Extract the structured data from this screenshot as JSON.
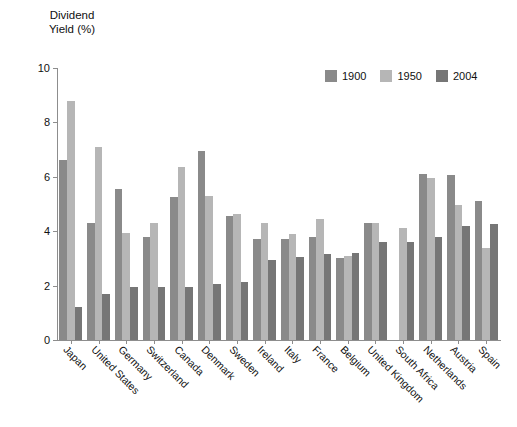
{
  "chart_data": {
    "type": "bar",
    "title": "Dividend\nYield (%)",
    "ylabel": "Dividend Yield (%)",
    "xlabel": "",
    "ylim": [
      0,
      10
    ],
    "yticks": [
      0,
      2,
      4,
      6,
      8,
      10
    ],
    "grid": false,
    "legend_position": "top-right",
    "categories": [
      "Japan",
      "United States",
      "Germany",
      "Switzerland",
      "Canada",
      "Denmark",
      "Sweden",
      "Ireland",
      "Italy",
      "France",
      "Belgium",
      "United Kingdom",
      "South Africa",
      "Netherlands",
      "Austria",
      "Spain"
    ],
    "series": [
      {
        "name": "1900",
        "color": "#8a8a8a",
        "values": [
          6.6,
          4.3,
          5.55,
          3.8,
          5.25,
          6.95,
          4.55,
          3.7,
          3.7,
          3.8,
          3.0,
          4.3,
          0.0,
          6.1,
          6.05,
          5.1
        ]
      },
      {
        "name": "1950",
        "color": "#b6b6b6",
        "values": [
          8.8,
          7.1,
          3.95,
          4.3,
          6.35,
          5.3,
          4.65,
          4.3,
          3.9,
          4.45,
          3.1,
          4.3,
          4.1,
          5.95,
          4.95,
          3.4
        ]
      },
      {
        "name": "2004",
        "color": "#767676",
        "values": [
          1.2,
          1.7,
          1.95,
          1.95,
          1.95,
          2.05,
          2.15,
          2.95,
          3.05,
          3.15,
          3.2,
          3.6,
          3.6,
          3.8,
          4.2,
          4.25
        ]
      }
    ]
  }
}
